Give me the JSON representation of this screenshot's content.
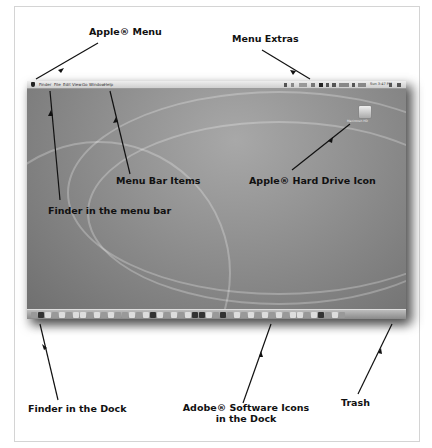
{
  "callouts": {
    "apple_menu": "Apple® Menu",
    "menu_extras": "Menu Extras",
    "menu_bar_items": "Menu Bar Items",
    "hard_drive_icon": "Apple® Hard Drive Icon",
    "finder_menu_bar": "Finder in the menu bar",
    "finder_dock": "Finder in the Dock",
    "adobe_icons_line1": "Adobe® Software Icons",
    "adobe_icons_line2": "in the Dock",
    "trash": "Trash"
  },
  "menubar": {
    "items": [
      "Finder",
      "File",
      "Edit",
      "View",
      "Go",
      "Window",
      "Help"
    ],
    "clock": "Sun 3:47 PM"
  },
  "desktop": {
    "hard_drive_label": "Macintosh HD"
  },
  "colors": {
    "arrow": "#111111",
    "frame_border": "#d4d4d4",
    "desktop": "#8e8e8e"
  }
}
